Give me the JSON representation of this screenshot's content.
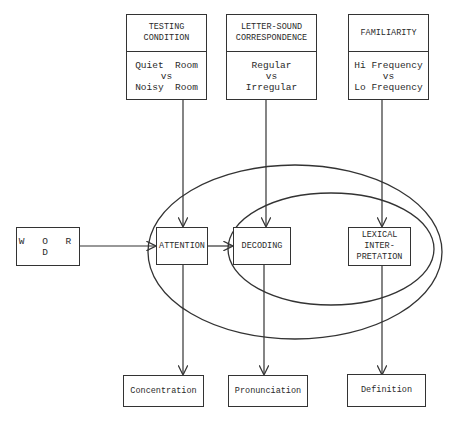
{
  "diagram": {
    "factors": [
      {
        "heading": [
          "TESTING",
          "CONDITION"
        ],
        "levels": [
          "Quiet  Room",
          "vs",
          "Noisy  Room"
        ]
      },
      {
        "heading": [
          "LETTER-SOUND",
          "CORRESPONDENCE"
        ],
        "levels": [
          "Regular",
          "vs",
          "Irregular"
        ]
      },
      {
        "heading": [
          "FAMILIARITY"
        ],
        "levels": [
          "Hi Frequency",
          "vs",
          "Lo Frequency"
        ]
      }
    ],
    "input": {
      "label": "W O R D"
    },
    "processes": [
      {
        "label": [
          "ATTENTION"
        ]
      },
      {
        "label": [
          "DECODING"
        ]
      },
      {
        "label": [
          "LEXICAL",
          "INTER-",
          "PRETATION"
        ]
      }
    ],
    "outcomes": [
      {
        "label": "Concentration"
      },
      {
        "label": "Pronunciation"
      },
      {
        "label": "Definition"
      }
    ],
    "colors": {
      "line": "#333333",
      "background": "#ffffff"
    }
  }
}
